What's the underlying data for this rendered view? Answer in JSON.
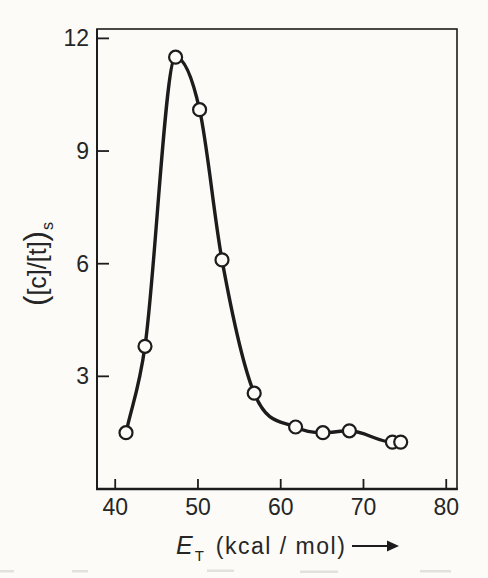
{
  "figure": {
    "ink_color": "#1c1c1c",
    "paper_color": "#fcfbf8",
    "text_color": "#262626"
  },
  "chart_data": {
    "type": "line",
    "xlabel": "E_T (kcal/mol)",
    "xlabel_parts": {
      "symbol": "E",
      "subscript": "T",
      "units": "(kcal / mol)",
      "arrow": "⟶"
    },
    "ylabel": "([c]/[t])s",
    "ylabel_parts": {
      "open": "(",
      "core": "[c]/[t]",
      "close": ")",
      "subscript": "s"
    },
    "xlim": [
      37.8,
      81.3
    ],
    "ylim": [
      0,
      12.25
    ],
    "x_ticks": [
      40,
      50,
      60,
      70,
      80
    ],
    "y_ticks": [
      3,
      6,
      9,
      12
    ],
    "grid": false,
    "legend": false,
    "marker": "open-circle",
    "series": [
      {
        "x": [
          41.3,
          43.6,
          47.3,
          50.2,
          52.9,
          56.8,
          61.8,
          65.1,
          68.3,
          73.5,
          74.5
        ],
        "y": [
          1.5,
          3.8,
          11.5,
          10.1,
          6.1,
          2.55,
          1.65,
          1.5,
          1.55,
          1.25,
          1.25
        ]
      }
    ]
  }
}
